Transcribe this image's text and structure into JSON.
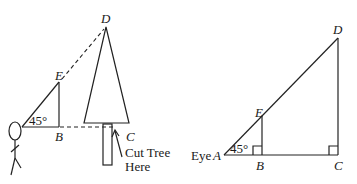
{
  "left_figure": {
    "labels": {
      "D": "D",
      "E": "E",
      "B": "B",
      "C": "C",
      "angle": "45°",
      "note_line1": "Cut Tree",
      "note_line2": "Here"
    }
  },
  "right_figure": {
    "labels": {
      "D": "D",
      "E": "E",
      "A": "Eye A",
      "eye": "Eye",
      "A_letter": "A",
      "B": "B",
      "C": "C",
      "angle": "45°"
    }
  }
}
